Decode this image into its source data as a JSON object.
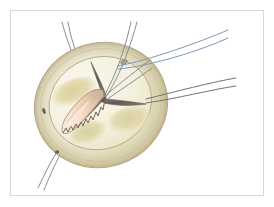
{
  "figure": {
    "kind": "medical-illustration",
    "frame": {
      "x": 10,
      "y": 10,
      "width": 254,
      "height": 186,
      "border_color": "#d9d9d9",
      "background": "#ffffff"
    },
    "canvas": {
      "width": 274,
      "height": 207,
      "background": "#ffffff"
    }
  },
  "palette": {
    "page_background": "#ffffff",
    "frame_border": "#d9d9d9",
    "aortic_wall_outline": "#b9a58c",
    "aortic_wall_fill_light": "#f3efdd",
    "aortic_wall_fill_mid": "#e8e2c4",
    "aortic_wall_fill_shadow": "#d7cfa8",
    "annulus_outline": "#b6ab86",
    "sinus_fill": "#e4ddb6",
    "sinus_shadow": "#d2c89a",
    "lumen_fill": "#f6f3e4",
    "commissure_dark": "#6c6458",
    "commissure_mid": "#8d8578",
    "leaflet_calcified_fill": "#f5ded0",
    "leaflet_calcified_edge": "#8a7b6b",
    "leaflet_calcified_shadow": "#e0c0a6",
    "suture_blue": "#7f97b8",
    "suture_gray": "#8a8c90",
    "suture_dark_gray": "#6f7276",
    "pledget_dot": "#4a4338"
  },
  "anatomy": {
    "aortic_root": {
      "label": "aortic root wall",
      "center_x": 101,
      "center_y": 105,
      "radius_x": 67,
      "radius_y": 62,
      "rotation_deg": -20
    },
    "annulus": {
      "label": "aortic annulus",
      "center_x": 101,
      "center_y": 105,
      "radius_x": 52,
      "radius_y": 46,
      "rotation_deg": -20
    },
    "commissures": {
      "label": "tri-leaflet commissure (Y-shaped)",
      "hub_x": 103,
      "hub_y": 98,
      "arm_count": 3
    },
    "sinuses": [
      {
        "name": "left-coronary-sinus",
        "cx": 72,
        "cy": 93
      },
      {
        "name": "right-coronary-sinus",
        "cx": 128,
        "cy": 119
      },
      {
        "name": "non-coronary-sinus",
        "cx": 88,
        "cy": 132
      }
    ],
    "calcified_leaflet": {
      "label": "thickened calcified leaflet",
      "tip_x": 67,
      "tip_y": 131,
      "base_x": 104,
      "base_y": 96
    },
    "ostia_marks": [
      {
        "name": "coronary-ostium-upper-right",
        "cx": 124,
        "cy": 62,
        "rx": 3.4,
        "ry": 2.2,
        "rot": -20
      },
      {
        "name": "ostium-mark-left",
        "cx": 44,
        "cy": 111,
        "rx": 1.8,
        "ry": 3.0,
        "rot": -20
      },
      {
        "name": "ostium-mark-lower-left",
        "cx": 57,
        "cy": 153,
        "rx": 2.2,
        "ry": 1.6,
        "rot": -20
      }
    ]
  },
  "sutures": [
    {
      "id": "suture-upper-right-blue-outer",
      "color_key": "suture_blue",
      "color": "#7f97b8",
      "width": 1.0,
      "path": "M 118 66 C 150 60 200 42 228 30"
    },
    {
      "id": "suture-upper-right-blue-inner",
      "color_key": "suture_blue",
      "color": "#7f97b8",
      "width": 1.0,
      "path": "M 118 69 C 152 66 202 50 228 38"
    },
    {
      "id": "suture-right-gray-outer",
      "color_key": "suture_dark_gray",
      "color": "#6f7276",
      "width": 1.0,
      "path": "M 146 99 C 174 92 212 82 236 78"
    },
    {
      "id": "suture-right-gray-inner",
      "color_key": "suture_dark_gray",
      "color": "#6f7276",
      "width": 1.0,
      "path": "M 146 103 C 175 99 214 89 236 86"
    },
    {
      "id": "suture-top-pair-a-left",
      "color_key": "suture_gray",
      "color": "#8a8c90",
      "width": 1.0,
      "path": "M 76 62 C 70 48 65 34 62 22"
    },
    {
      "id": "suture-top-pair-a-right",
      "color_key": "suture_gray",
      "color": "#8a8c90",
      "width": 1.0,
      "path": "M 80 62 C 74 48 70 34 68 22"
    },
    {
      "id": "suture-top-pair-b-left",
      "color_key": "suture_gray",
      "color": "#8a8c90",
      "width": 1.0,
      "path": "M 103 98 C 118 72 126 44 131 22"
    },
    {
      "id": "suture-top-pair-b-right",
      "color_key": "suture_gray",
      "color": "#8a8c90",
      "width": 1.0,
      "path": "M 106 97 C 122 72 131 44 137 22"
    },
    {
      "id": "suture-hub-to-upper-right-a",
      "color_key": "suture_gray",
      "color": "#8a8c90",
      "width": 1.0,
      "path": "M 103 98 C 116 86 132 74 150 60"
    },
    {
      "id": "suture-hub-to-upper-right-b",
      "color_key": "suture_gray",
      "color": "#8a8c90",
      "width": 1.0,
      "path": "M 106 100 C 120 90 136 80 152 68"
    },
    {
      "id": "suture-lower-left-outer",
      "color_key": "suture_gray",
      "color": "#8a8c90",
      "width": 1.0,
      "path": "M 61 153 C 54 166 48 180 44 190"
    },
    {
      "id": "suture-lower-left-inner",
      "color_key": "suture_gray",
      "color": "#8a8c90",
      "width": 1.0,
      "path": "M 57 152 C 49 164 43 178 38 188"
    }
  ]
}
